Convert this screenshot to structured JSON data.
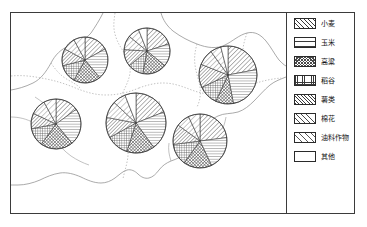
{
  "figure": {
    "type": "thematic-map",
    "frame_color": "#3b3b3b",
    "background": "#ffffff"
  },
  "legend": {
    "title": "",
    "items": [
      {
        "key": "wheat",
        "label": "小麦",
        "pattern": "diagonal-hatch-right",
        "swatch_class": "p-wheat"
      },
      {
        "key": "corn",
        "label": "玉米",
        "pattern": "horizontal-lines",
        "swatch_class": "p-corn"
      },
      {
        "key": "sorghum",
        "label": "高粱",
        "pattern": "cross-hatch-dense",
        "swatch_class": "p-sorghum"
      },
      {
        "key": "rice",
        "label": "稻谷",
        "pattern": "square-grid",
        "swatch_class": "p-rice"
      },
      {
        "key": "tuber",
        "label": "薯类",
        "pattern": "diagonal-hatch-tight",
        "swatch_class": "p-tuber"
      },
      {
        "key": "cotton",
        "label": "棉花",
        "pattern": "diagonal-hatch-light",
        "swatch_class": "p-cotton"
      },
      {
        "key": "oil",
        "label": "油料作物",
        "pattern": "diagonal-hatch-sparse",
        "swatch_class": "p-oil"
      },
      {
        "key": "other",
        "label": "其他",
        "pattern": "blank",
        "swatch_class": "p-other"
      }
    ]
  },
  "chart_data": {
    "type": "pie",
    "title": "",
    "xlabel": "",
    "ylabel": "",
    "legend_position": "right",
    "grid": false,
    "categories": [
      "小麦",
      "玉米",
      "高粱",
      "稻谷",
      "薯类",
      "棉花",
      "油料作物",
      "其他"
    ],
    "pies": [
      {
        "name": "pie-northwest",
        "cx": 74,
        "cy": 47,
        "r": 23,
        "values": [
          17,
          22,
          19,
          13,
          12,
          9,
          8,
          0
        ]
      },
      {
        "name": "pie-north",
        "cx": 136,
        "cy": 38,
        "r": 23,
        "values": [
          20,
          16,
          17,
          11,
          12,
          10,
          8,
          6
        ]
      },
      {
        "name": "pie-northeast",
        "cx": 217,
        "cy": 62,
        "r": 29,
        "values": [
          22,
          25,
          10,
          11,
          13,
          9,
          6,
          4
        ]
      },
      {
        "name": "pie-west",
        "cx": 45,
        "cy": 111,
        "r": 25,
        "values": [
          15,
          24,
          21,
          12,
          10,
          10,
          8,
          0
        ]
      },
      {
        "name": "pie-central",
        "cx": 125,
        "cy": 110,
        "r": 30,
        "values": [
          19,
          21,
          15,
          12,
          11,
          9,
          7,
          6
        ]
      },
      {
        "name": "pie-southeast",
        "cx": 189,
        "cy": 128,
        "r": 27,
        "values": [
          23,
          20,
          17,
          13,
          12,
          8,
          7,
          0
        ]
      }
    ]
  }
}
